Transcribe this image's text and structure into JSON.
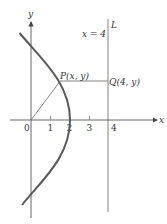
{
  "diagram": {
    "axes": {
      "x_label": "x",
      "y_label": "y",
      "x_ticks": [
        "0",
        "1",
        "2",
        "3",
        "4"
      ]
    },
    "line_L": {
      "name": "L",
      "equation": "x = 4"
    },
    "points": {
      "P": "P(x, y)",
      "Q": "Q(4, y)"
    },
    "curve": {
      "description": "parabola y^2 = 16 - 8x, points equidistant from origin and line x = 4",
      "vertex_x": 2,
      "y_intercepts": [
        4,
        -4
      ]
    },
    "colors": {
      "curve": "#5a5a5a",
      "axis": "#555555",
      "text": "#333333"
    }
  }
}
